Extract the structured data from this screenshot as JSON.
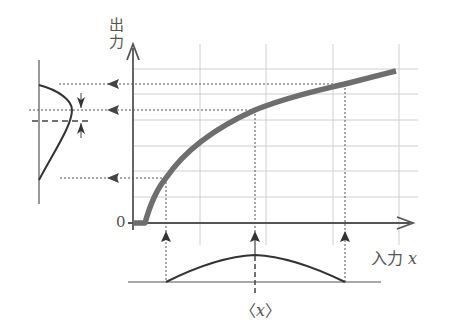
{
  "diagram": {
    "labels": {
      "y_axis": "出力",
      "y_axis_line1": "出",
      "y_axis_line2": "力",
      "x_axis": "入力",
      "x_axis_var": "x",
      "origin": "0",
      "mean_input": "<x>",
      "mean_open": "〈",
      "mean_var": "x",
      "mean_close": "〉"
    },
    "colors": {
      "curve": "#6e6e6e",
      "axis": "#555555",
      "grid": "#cfcfcf",
      "guide": "#555555",
      "distribution": "#333333"
    },
    "grid": {
      "vertical_x": [
        200,
        266,
        333,
        399
      ],
      "horizontal_y": [
        69,
        94,
        120,
        146,
        171,
        197
      ]
    },
    "input_samples": [
      {
        "name": "low",
        "x": 166,
        "y_out": 178
      },
      {
        "name": "mean",
        "x": 255,
        "y_out": 110
      },
      {
        "name": "high",
        "x": 345,
        "y_out": 84
      }
    ],
    "output_distribution": {
      "peak_y": 110,
      "mean_y": 121,
      "note": "output mean shifted relative to peak (arrows indicate gap)"
    },
    "input_distribution": {
      "start_x": 166,
      "peak_x": 255,
      "end_x": 345,
      "shape": "symmetric bump"
    }
  }
}
